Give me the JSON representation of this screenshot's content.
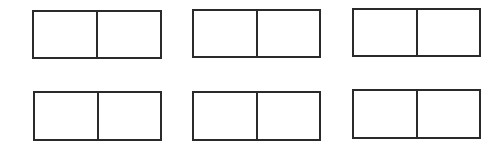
{
  "diagram": {
    "stroke_color": "#2a2a2a",
    "background": "#ffffff",
    "boxes": [
      {
        "x": 32,
        "y": 10,
        "w": 130,
        "h": 49,
        "cells": [
          "",
          ""
        ]
      },
      {
        "x": 192,
        "y": 9,
        "w": 129,
        "h": 49,
        "cells": [
          "",
          ""
        ]
      },
      {
        "x": 352,
        "y": 8,
        "w": 129,
        "h": 49,
        "cells": [
          "",
          ""
        ]
      },
      {
        "x": 33,
        "y": 91,
        "w": 129,
        "h": 50,
        "cells": [
          "",
          ""
        ]
      },
      {
        "x": 192,
        "y": 91,
        "w": 129,
        "h": 50,
        "cells": [
          "",
          ""
        ]
      },
      {
        "x": 352,
        "y": 89,
        "w": 129,
        "h": 50,
        "cells": [
          "",
          ""
        ]
      }
    ]
  }
}
